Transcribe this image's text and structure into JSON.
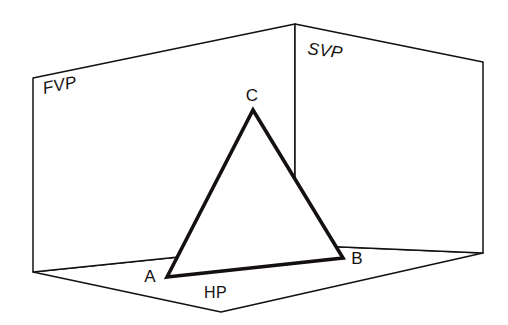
{
  "figure": {
    "background_color": "#ffffff",
    "line_color": "#14100f",
    "width": 508,
    "height": 325
  },
  "planes": {
    "fvp": {
      "label": "FVP",
      "label_x": 44,
      "label_y": 94,
      "label_rotation": -11.6,
      "corners": "33,78 295,24 295,245 33,272"
    },
    "svp": {
      "label": "SVP",
      "label_x": 307,
      "label_y": 54,
      "label_rotation": 7.5,
      "corners": "295,24 483,62 483,253 295,245"
    },
    "hp": {
      "label": "HP",
      "label_x": 204,
      "label_y": 298,
      "label_rotation": 0,
      "corners": "33,272 295,245 483,253 221,312"
    }
  },
  "shape": {
    "name": "triangle-abc",
    "points": "167,277 343,258 253,110",
    "vertices": [
      {
        "label": "A",
        "x": 167,
        "y": 277,
        "label_x": 150,
        "label_y": 282
      },
      {
        "label": "B",
        "x": 343,
        "y": 258,
        "label_x": 357,
        "label_y": 264
      },
      {
        "label": "C",
        "x": 253,
        "y": 110,
        "label_x": 252,
        "label_y": 101
      }
    ]
  }
}
